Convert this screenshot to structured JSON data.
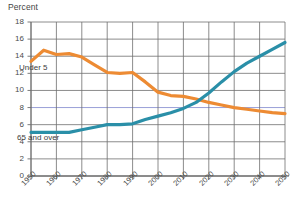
{
  "chart_data": {
    "type": "line",
    "title": "",
    "subtitle": "",
    "ylabel": "Percent",
    "xlabel": "",
    "xlim": [
      1950,
      2050
    ],
    "ylim": [
      0,
      18
    ],
    "ytick_step": 2,
    "yticks": [
      "18",
      "16",
      "14",
      "12",
      "10",
      "8",
      "6",
      "4",
      "2",
      "0"
    ],
    "xticks": [
      "1950",
      "1960",
      "1970",
      "1980",
      "1990",
      "2000",
      "2010",
      "2020",
      "2030",
      "2040",
      "2050"
    ],
    "grid": "both",
    "legend_position": "inline-annotation",
    "series": [
      {
        "name": "Under 5",
        "color": "#ED8B33",
        "annotation": "Under 5",
        "x": [
          1950,
          1955,
          1960,
          1965,
          1970,
          1975,
          1980,
          1985,
          1990,
          1995,
          2000,
          2005,
          2010,
          2015,
          2020,
          2025,
          2030,
          2035,
          2040,
          2045,
          2050
        ],
        "values": [
          13.4,
          14.7,
          14.2,
          14.3,
          13.9,
          13.0,
          12.1,
          12.0,
          12.1,
          11.0,
          9.8,
          9.4,
          9.3,
          9.0,
          8.6,
          8.3,
          8.0,
          7.8,
          7.6,
          7.4,
          7.3
        ]
      },
      {
        "name": "65 and over",
        "color": "#2A8FA8",
        "annotation": "65 and over",
        "x": [
          1950,
          1955,
          1960,
          1965,
          1970,
          1975,
          1980,
          1985,
          1990,
          1995,
          2000,
          2005,
          2010,
          2015,
          2020,
          2025,
          2030,
          2035,
          2040,
          2045,
          2050
        ],
        "values": [
          5.1,
          5.1,
          5.1,
          5.1,
          5.4,
          5.7,
          6.0,
          6.0,
          6.1,
          6.6,
          7.0,
          7.4,
          7.9,
          8.6,
          9.7,
          11.0,
          12.2,
          13.2,
          14.0,
          14.8,
          15.6
        ]
      }
    ],
    "highlight_gridline": {
      "value": 8,
      "color": "#9aa0d8"
    }
  }
}
